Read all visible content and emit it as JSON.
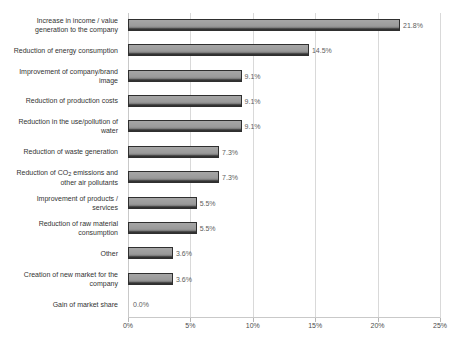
{
  "chart_data": {
    "type": "bar",
    "orientation": "horizontal",
    "title": "",
    "xlabel": "",
    "ylabel": "",
    "xlim": [
      0,
      25
    ],
    "grid": true,
    "legend": false,
    "tick_labels": [
      "0%",
      "5%",
      "10%",
      "15%",
      "20%",
      "25%"
    ],
    "tick_values": [
      0,
      5,
      10,
      15,
      20,
      25
    ],
    "categories": [
      "Increase in income / value generation to the company",
      "Reduction of energy consumption",
      "Improvement of company/brand image",
      "Reduction of production costs",
      "Reduction in the use/pollution of water",
      "Reduction of waste generation",
      "Reduction of CO2 emissions and other air pollutants",
      "Improvement of products / services",
      "Reduction of raw material consumption",
      "Other",
      "Creation of new market for the company",
      "Gain of market share"
    ],
    "values": [
      21.8,
      14.5,
      9.1,
      9.1,
      9.1,
      7.3,
      7.3,
      5.5,
      5.5,
      3.6,
      3.6,
      0.0
    ],
    "data_labels": [
      "21.8%",
      "14.5%",
      "9.1%",
      "9.1%",
      "9.1%",
      "7.3%",
      "7.3%",
      "5.5%",
      "5.5%",
      "3.6%",
      "3.6%",
      "0.0%"
    ],
    "bar_color": "#9b9b9b",
    "bar_edge_color": "#2f2f2f",
    "grid_color": "#d9d9d9",
    "text_color": "#333333"
  },
  "category_lines": [
    [
      "Increase in income / value",
      "generation to the company"
    ],
    [
      "Reduction of energy consumption"
    ],
    [
      "Improvement of company/brand",
      "image"
    ],
    [
      "Reduction of production costs"
    ],
    [
      "Reduction in the use/pollution of",
      "water"
    ],
    [
      "Reduction of waste generation"
    ],
    [
      "Reduction of CO",
      "SUB2",
      " emissions and",
      "other air pollutants"
    ],
    [
      "Improvement of products /",
      "services"
    ],
    [
      "Reduction of raw material",
      "consumption"
    ],
    [
      "Other"
    ],
    [
      "Creation of new market for the",
      "company"
    ],
    [
      "Gain of market share"
    ]
  ]
}
